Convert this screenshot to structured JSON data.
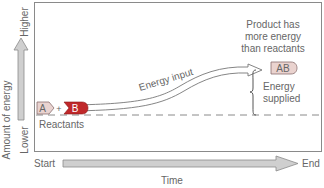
{
  "diagram": {
    "y_axis": {
      "label": "Amount of energy",
      "high_label": "Higher",
      "low_label": "Lower"
    },
    "x_axis": {
      "label": "Time",
      "start_label": "Start",
      "end_label": "End"
    },
    "reactants": {
      "label": "Reactants",
      "molecule_a": "A",
      "plus": "+",
      "molecule_b": "B"
    },
    "arrow_label": "Energy input",
    "product": {
      "caption_lines": [
        "Product has",
        "more energy",
        "than reactants"
      ],
      "molecule": "AB"
    },
    "energy_supplied_lines": [
      "Energy",
      "supplied"
    ],
    "colors": {
      "frame": "#8a8a8a",
      "arrow_fill": "#cfcfcf",
      "arrow_stroke": "#8a8a8a",
      "molecule_a_fill": "#e9d3d0",
      "molecule_b_fill": "#c0282a",
      "product_fill": "#ead3cf",
      "dashed_line": "#8a8a8a",
      "text": "#666666"
    }
  }
}
